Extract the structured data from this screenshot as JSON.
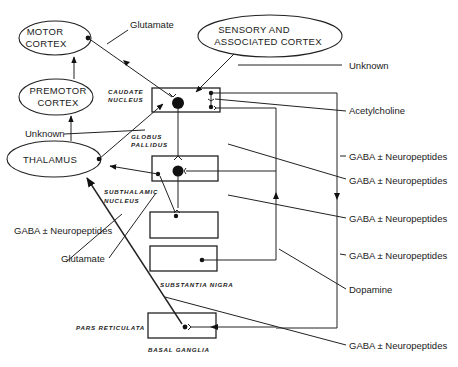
{
  "diagram": {
    "nodes": {
      "motor_cortex": [
        "MOTOR",
        "CORTEX"
      ],
      "premotor_cortex": [
        "PREMOTOR",
        "CORTEX"
      ],
      "thalamus": "THALAMUS",
      "sensory_cortex": [
        "SENSORY AND",
        "ASSOCIATED CORTEX"
      ]
    },
    "region_labels": {
      "caudate": [
        "CAUDATE",
        "NUCLEUS"
      ],
      "globus": [
        "GLOBUS",
        "PALLIDUS"
      ],
      "subthalamic": [
        "SUBTHALAMIC",
        "NUCLEUS"
      ],
      "substantia_nigra": "SUBSTANTIA NIGRA",
      "pars_reticulata": "PARS RETICULATA",
      "basal_ganglia": "BASAL GANGLIA"
    },
    "transmitters": {
      "glutamate_top": "Glutamate",
      "unknown_right": "Unknown",
      "acetylcholine": "Acetylcholine",
      "unknown_left": "Unknown",
      "gaba_1": "GABA ± Neuropeptides",
      "gaba_2": "GABA ± Neuropeptides",
      "gaba_left": "GABA ± Neuropeptides",
      "gaba_3": "GABA ± Neuropeptides",
      "glutamate_left": "Glutamate",
      "gaba_4": "GABA ± Neuropeptides",
      "dopamine": "Dopamine",
      "gaba_5": "GABA ± Neuropeptides"
    }
  }
}
